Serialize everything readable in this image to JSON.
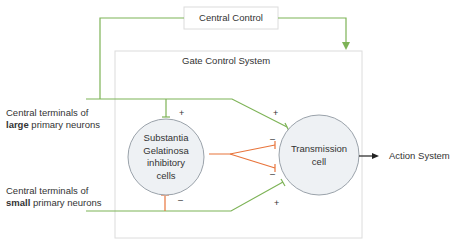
{
  "colors": {
    "excitatory": "#7db356",
    "inhibitory": "#e8743b",
    "box_border": "#dcdcdc",
    "circle_fill": "#eef1f4",
    "circle_border": "#9aa2aa",
    "arrow": "#222222"
  },
  "central_control": {
    "label": "Central Control"
  },
  "gate_control_system": {
    "label": "Gate Control System"
  },
  "inputs": {
    "large": {
      "line1": "Central terminals of",
      "bold": "large",
      "rest": " primary neurons"
    },
    "small": {
      "line1": "Central terminals of",
      "bold": "small",
      "rest": " primary neurons"
    }
  },
  "nodes": {
    "substantia": {
      "lines": [
        "Substantia",
        "Gelatinosa",
        "inhibitory",
        "cells"
      ]
    },
    "transmission": {
      "lines": [
        "Transmission",
        "cell"
      ]
    }
  },
  "output": {
    "label": "Action System"
  },
  "signs": {
    "sg_from_large": "+",
    "sg_from_small": "–",
    "t_from_large": "+",
    "t_from_sg_top": "–",
    "t_from_sg_bottom": "–",
    "t_from_small": "+"
  }
}
